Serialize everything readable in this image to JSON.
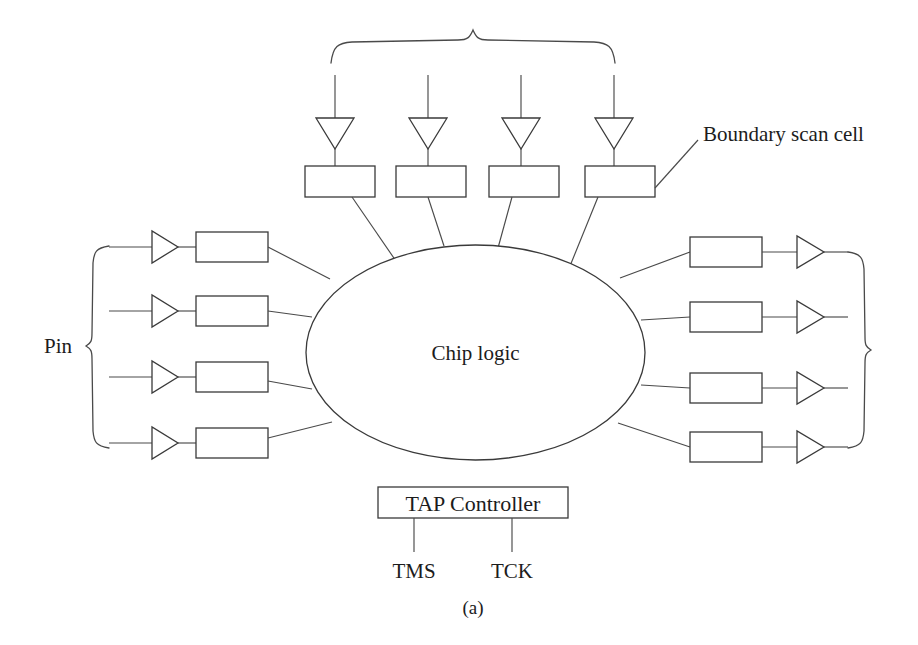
{
  "figure": {
    "caption": "(a)",
    "chip_label": "Chip logic",
    "pin_label": "Pin",
    "callout_label": "Boundary scan cell",
    "tap": {
      "title": "TAP  Controller",
      "signals": [
        "TMS",
        "TCK"
      ]
    },
    "colors": {
      "line": "#3a3a3a",
      "text": "#1c1c1c",
      "background": "#ffffff"
    },
    "top_cells": [
      {
        "index": 1,
        "buffer": "input-buffer-triangle",
        "cell": "boundary-scan-cell"
      },
      {
        "index": 2,
        "buffer": "input-buffer-triangle",
        "cell": "boundary-scan-cell"
      },
      {
        "index": 3,
        "buffer": "input-buffer-triangle",
        "cell": "boundary-scan-cell"
      },
      {
        "index": 4,
        "buffer": "input-buffer-triangle",
        "cell": "boundary-scan-cell"
      }
    ],
    "left_rows": [
      {
        "index": 1,
        "buffer": "input-buffer-triangle",
        "cell": "boundary-scan-cell"
      },
      {
        "index": 2,
        "buffer": "input-buffer-triangle",
        "cell": "boundary-scan-cell"
      },
      {
        "index": 3,
        "buffer": "input-buffer-triangle",
        "cell": "boundary-scan-cell"
      },
      {
        "index": 4,
        "buffer": "input-buffer-triangle",
        "cell": "boundary-scan-cell"
      }
    ],
    "right_rows": [
      {
        "index": 1,
        "cell": "boundary-scan-cell",
        "buffer": "output-buffer-triangle"
      },
      {
        "index": 2,
        "cell": "boundary-scan-cell",
        "buffer": "output-buffer-triangle"
      },
      {
        "index": 3,
        "cell": "boundary-scan-cell",
        "buffer": "output-buffer-triangle"
      },
      {
        "index": 4,
        "cell": "boundary-scan-cell",
        "buffer": "output-buffer-triangle"
      }
    ],
    "braces": [
      "top-brace",
      "left-pin-brace",
      "right-pin-brace"
    ]
  }
}
